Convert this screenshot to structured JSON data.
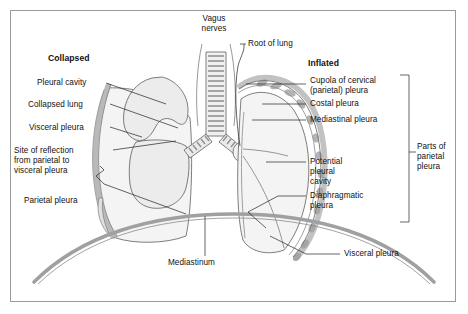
{
  "figure": {
    "background_color": "#ffffff",
    "border_color": "#9a9a9a",
    "line_color": "#555555",
    "fill_light": "#f2f2f2",
    "fill_mid": "#e3e3e3",
    "fill_dark": "#bdbdbd"
  },
  "headings": {
    "left": "Collapsed",
    "right": "Inflated"
  },
  "labels": {
    "vagus_nerves": "Vagus\nnerves",
    "root_of_lung": "Root of lung",
    "pleural_cavity": "Pleural cavity",
    "collapsed_lung": "Collapsed lung",
    "visceral_pleura_left": "Visceral pleura",
    "site_of_reflection": "Site of reflection\nfrom parietal to\nvisceral pleura",
    "parietal_pleura": "Parietal pleura",
    "mediastinum": "Mediastinum",
    "cupola": "Cupola of cervical\n(parietal) pleura",
    "costal_pleura": "Costal pleura",
    "mediastinal_pleura": "Mediastinal pleura",
    "potential_pleural_cavity": "Potential\npleural\ncavity",
    "diaphragmatic_pleura": "Diaphragmatic\npleura",
    "visceral_pleura_right": "Visceral pleura",
    "parts_of_parietal_pleura": "Parts of\nparietal\npleura"
  },
  "anatomy": {
    "structures": [
      "trachea",
      "left main bronchus",
      "right main bronchus",
      "collapsed left lung",
      "inflated right lung",
      "diaphragm",
      "parietal pleura",
      "visceral pleura",
      "pleural cavity",
      "vagus nerves"
    ]
  }
}
